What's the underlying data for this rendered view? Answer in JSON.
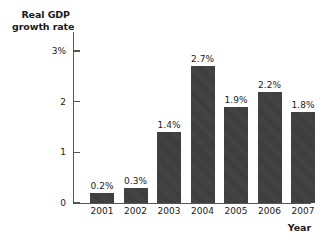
{
  "chart_data": {
    "type": "bar",
    "title": "",
    "subtitle": "",
    "xlabel": "Year",
    "ylabel": "Real GDP growth rate",
    "ylabel_line1": "Real GDP",
    "ylabel_line2": "growth rate",
    "categories": [
      "2001",
      "2002",
      "2003",
      "2004",
      "2005",
      "2006",
      "2007"
    ],
    "values": [
      0.2,
      0.3,
      1.4,
      2.7,
      1.9,
      2.2,
      1.8
    ],
    "data_labels": [
      "0.2%",
      "0.3%",
      "1.4%",
      "2.7%",
      "1.9%",
      "2.2%",
      "1.8%"
    ],
    "ylim": [
      0,
      3
    ],
    "y_ticks": [
      0,
      1,
      2,
      3
    ],
    "y_tick_labels": [
      "0",
      "1",
      "2",
      "3%"
    ],
    "grid": false,
    "legend": null,
    "bar_color": "#3b3b3b",
    "axis_color": "#555555",
    "background_color": "#ffffff",
    "text_color": "#1a1a1a"
  }
}
